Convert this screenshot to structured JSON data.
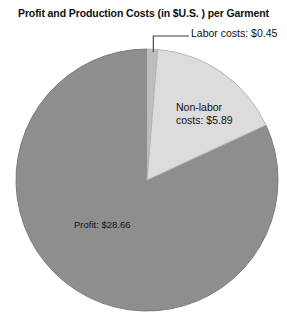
{
  "chart_data": {
    "type": "pie",
    "title": "Profit and Production Costs (in $U.S. ) per Garment",
    "currency": "$U.S.",
    "unit": "per Garment",
    "total": 35.0,
    "categories": [
      "Labor costs",
      "Non-labor costs",
      "Profit"
    ],
    "values": [
      0.45,
      5.89,
      28.66
    ],
    "value_labels": [
      "$0.45",
      "$5.89",
      "$28.66"
    ],
    "percentages": [
      1.3,
      16.8,
      81.9
    ],
    "start_angle_deg": 0,
    "direction": "clockwise",
    "legend": "none",
    "grid": false,
    "slices": [
      {
        "name": "labor-costs",
        "label_line1": "Labor costs: $0.45",
        "label_full": "Labor costs: $0.45",
        "value": 0.45,
        "percent": 1.3,
        "color": "#bdbdbd",
        "leader_line": true
      },
      {
        "name": "non-labor-costs",
        "label_line1": "Non-labor",
        "label_line2": "costs: $5.89",
        "label_full": "Non-labor costs: $5.89",
        "value": 5.89,
        "percent": 16.8,
        "color": "#dcdcdc",
        "leader_line": false
      },
      {
        "name": "profit",
        "label_line1": "Profit: $28.66",
        "label_full": "Profit: $28.66",
        "value": 28.66,
        "percent": 81.9,
        "color": "#8e8e8e",
        "leader_line": false
      }
    ],
    "colors": {
      "background": "#ffffff",
      "profit_slice": "#8e8e8e",
      "nonlabor_slice": "#dcdcdc",
      "labor_slice": "#bdbdbd",
      "outline": "#7a7a7a",
      "text": "#111111",
      "leader": "#555555"
    },
    "geometry": {
      "center_x": 147,
      "center_y": 180,
      "radius": 131
    }
  }
}
